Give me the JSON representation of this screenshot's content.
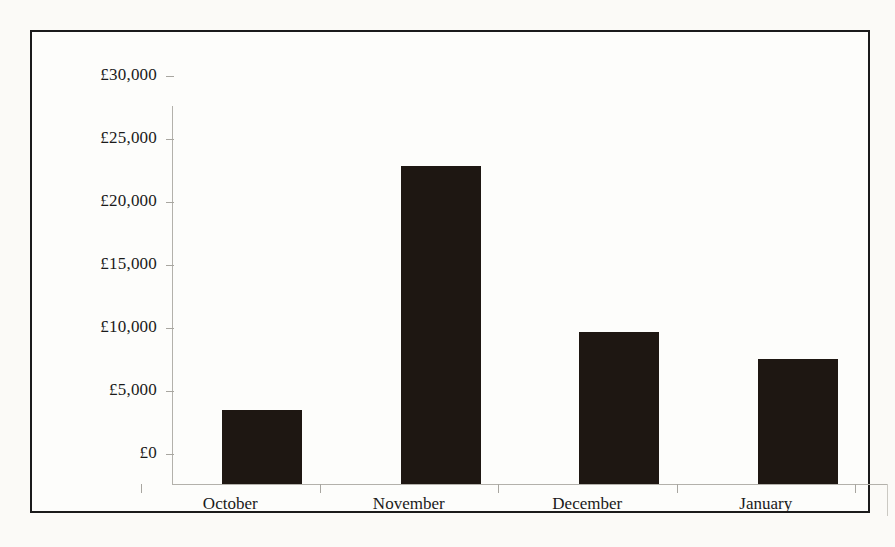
{
  "chart_data": {
    "type": "bar",
    "title": "",
    "xlabel": "",
    "ylabel": "",
    "categories": [
      "October",
      "November",
      "December",
      "January"
    ],
    "values": [
      5900,
      25200,
      12100,
      9900
    ],
    "ylim": [
      0,
      30000
    ],
    "ytick_values": [
      30000,
      25000,
      20000,
      15000,
      10000,
      5000,
      0
    ],
    "ytick_labels": [
      "£30,000",
      "£25,000",
      "£20,000",
      "£15,000",
      "£10,000",
      "£5,000",
      "£0"
    ],
    "currency_symbol": "£",
    "grid": false,
    "legend": false,
    "bar_color": "#1e1712",
    "axis_color": "#b3b1ab",
    "frame_color": "#1b1b1b",
    "background_color": "#fdfdfb",
    "page_background_color": "#fbfaf7"
  }
}
